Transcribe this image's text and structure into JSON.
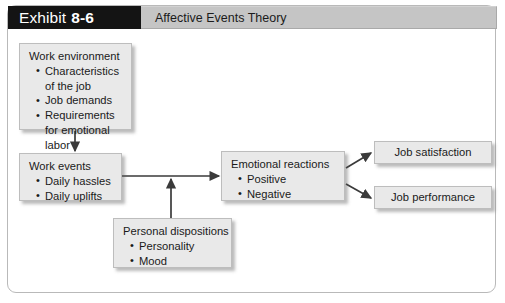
{
  "header": {
    "exhibit_label": "Exhibit",
    "exhibit_number": "8-6",
    "title": "Affective Events Theory"
  },
  "colors": {
    "exhibit_block_bg": "#141414",
    "exhibit_block_text": "#ffffff",
    "title_bar_bg": "#c5c5c5",
    "box_fill": "#e9e9e9",
    "box_border": "#bdbdbd",
    "connector": "#3a3a3a",
    "frame_border": "#b9b9b9",
    "page_bg": "#ffffff"
  },
  "diagram": {
    "nodes": {
      "work_environment": {
        "title": "Work environment",
        "bullets": [
          "Characteristics of the job",
          "Job demands",
          "Requirements for emotional labor"
        ]
      },
      "work_events": {
        "title": "Work events",
        "bullets": [
          "Daily hassles",
          "Daily uplifts"
        ]
      },
      "personal_dispositions": {
        "title": "Personal dispositions",
        "bullets": [
          "Personality",
          "Mood"
        ]
      },
      "emotional_reactions": {
        "title": "Emotional reactions",
        "bullets": [
          "Positive",
          "Negative"
        ]
      },
      "job_satisfaction": {
        "title": "Job satisfaction"
      },
      "job_performance": {
        "title": "Job performance"
      }
    },
    "connectors": [
      {
        "name": "work-environment-to-work-events",
        "from": "work_environment",
        "to": "work_events",
        "direction": "down"
      },
      {
        "name": "work-events-to-emotional-reactions",
        "from": "work_events",
        "to": "emotional_reactions",
        "direction": "right"
      },
      {
        "name": "personal-dispositions-to-link",
        "from": "personal_dispositions",
        "to": "work-events-to-emotional-reactions",
        "direction": "up"
      },
      {
        "name": "emotional-reactions-to-job-satisfaction",
        "from": "emotional_reactions",
        "to": "job_satisfaction",
        "direction": "up-right"
      },
      {
        "name": "emotional-reactions-to-job-performance",
        "from": "emotional_reactions",
        "to": "job_performance",
        "direction": "down-right"
      }
    ]
  }
}
